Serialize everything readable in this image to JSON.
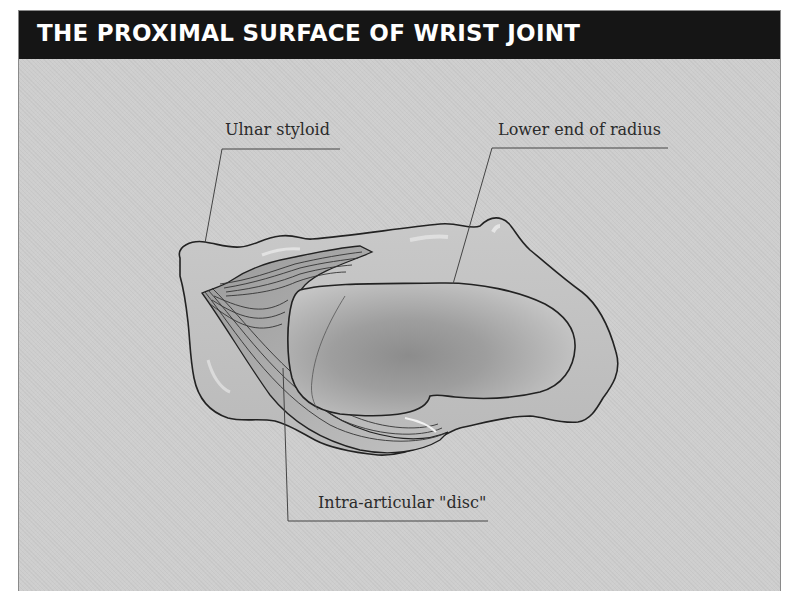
{
  "header": {
    "title": "THE PROXIMAL SURFACE OF WRIST JOINT"
  },
  "labels": {
    "ulnar_styloid": "Ulnar styloid",
    "lower_end_radius": "Lower end of radius",
    "intra_articular_disc": "Intra-articular \"disc\""
  },
  "colors": {
    "header_bg": "#151515",
    "header_text": "#ffffff",
    "panel_bg": "#cecece",
    "outline": "#222222",
    "label_text": "#2b2b2b"
  }
}
